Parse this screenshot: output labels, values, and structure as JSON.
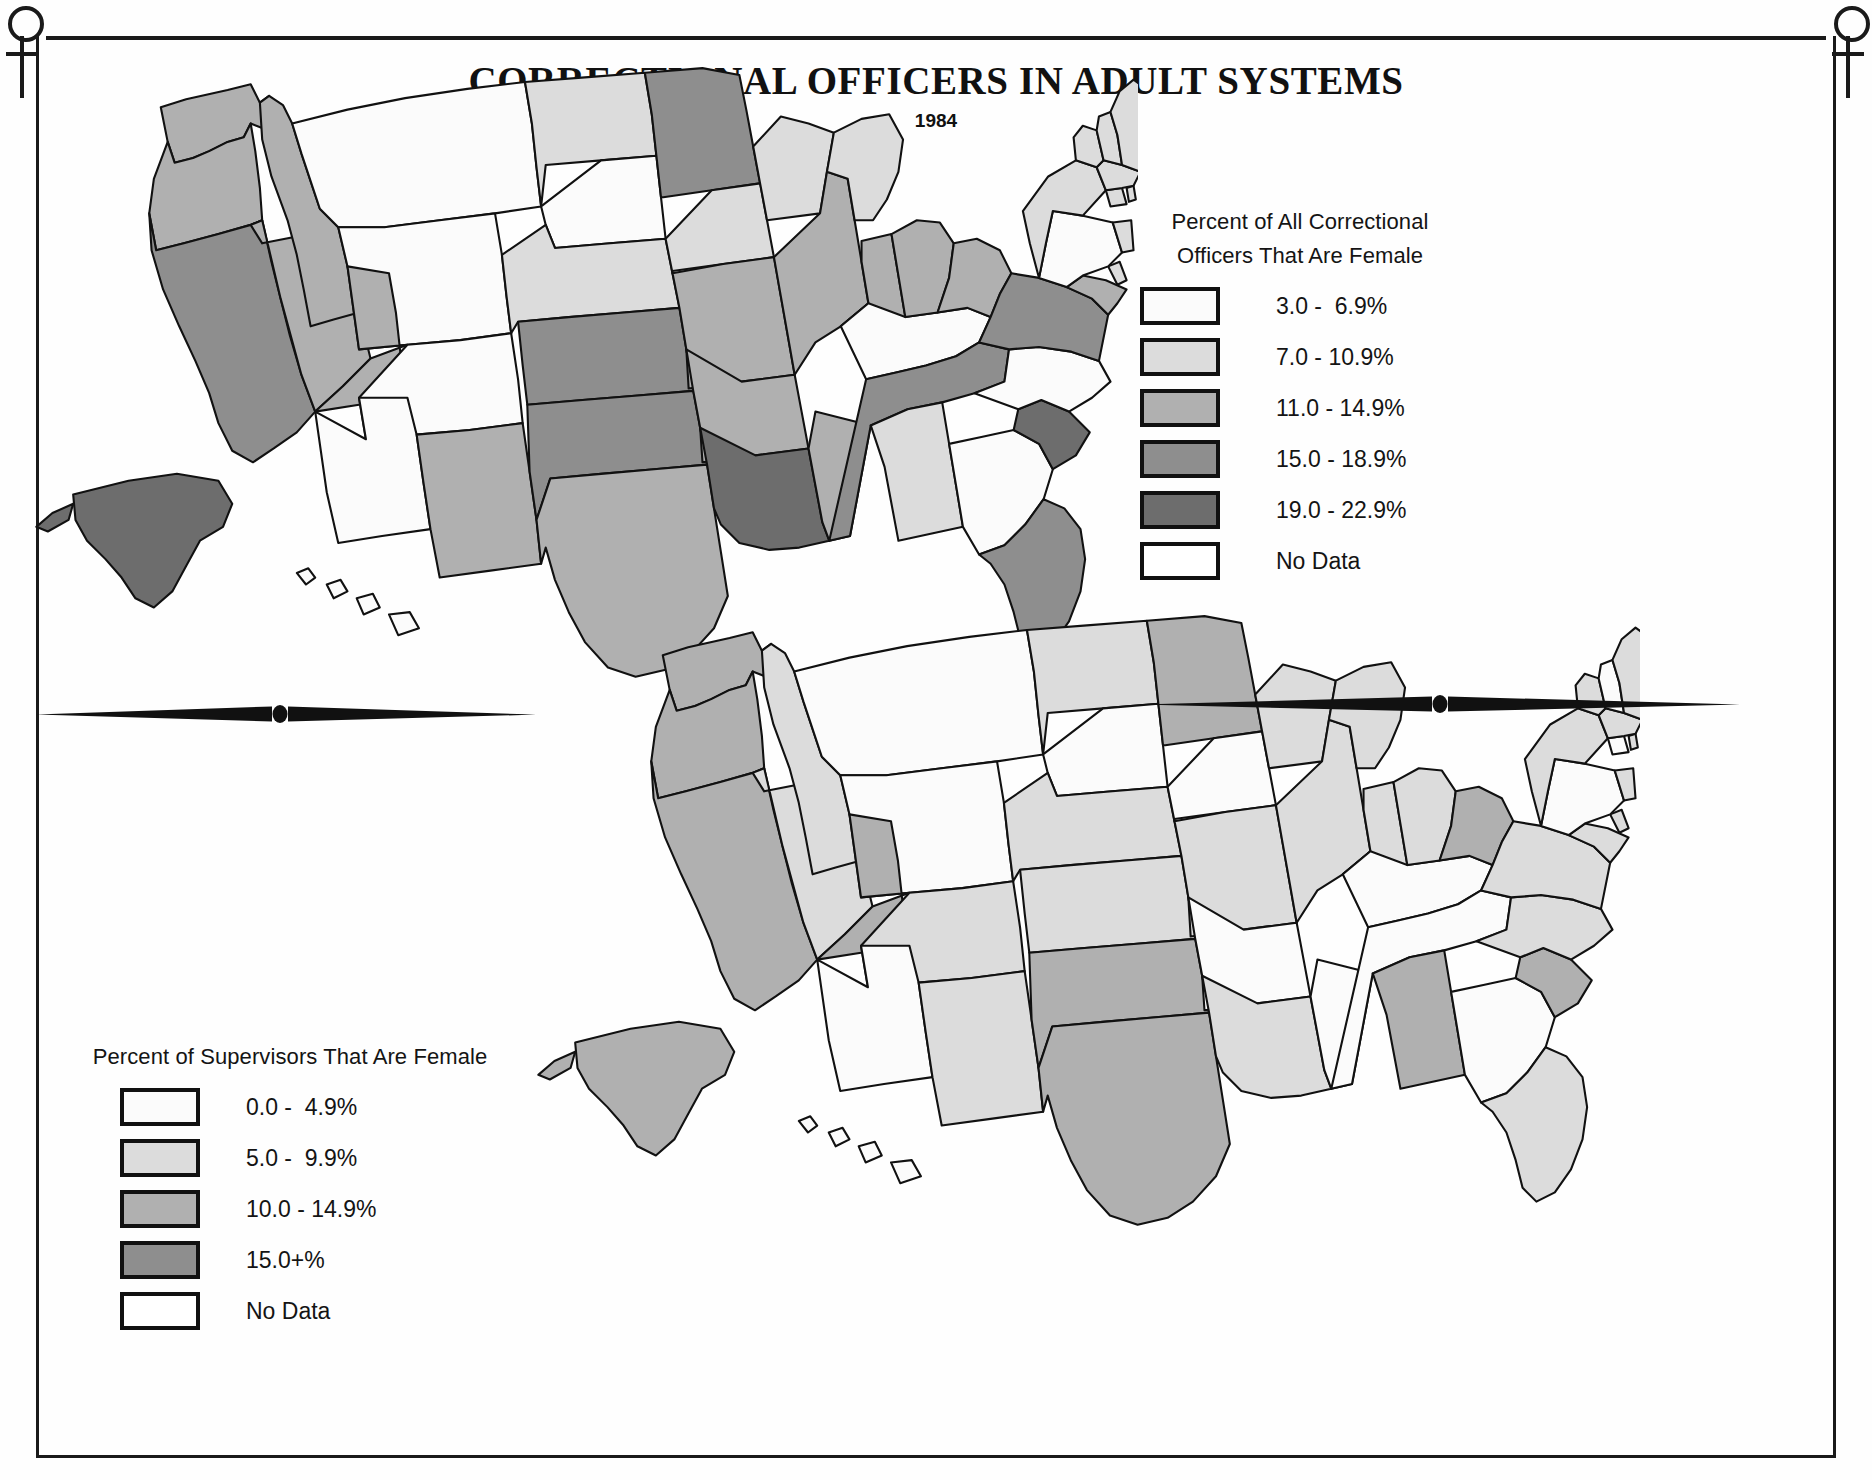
{
  "header": {
    "title": "CORRECTIONAL OFFICERS IN ADULT SYSTEMS",
    "subtitle": "1984"
  },
  "ornaments": {
    "venus_left": "venus-symbol",
    "venus_right": "venus-symbol",
    "divider_top": "tapered-rule-with-dot",
    "divider_bottom": "tapered-rule-with-dot"
  },
  "legend_top": {
    "title_line1": "Percent of All Correctional",
    "title_line2": "Officers That Are Female",
    "items": [
      {
        "label": "3.0 -  6.9%",
        "color": "#fbfbfb"
      },
      {
        "label": "7.0 - 10.9%",
        "color": "#dcdcdc"
      },
      {
        "label": "11.0 - 14.9%",
        "color": "#b0b0b0"
      },
      {
        "label": "15.0 - 18.9%",
        "color": "#8e8e8e"
      },
      {
        "label": "19.0 - 22.9%",
        "color": "#6d6d6d"
      },
      {
        "label": "No Data",
        "color": "#ffffff"
      }
    ]
  },
  "legend_bottom": {
    "title_line1": "Percent of Supervisors That Are Female",
    "items": [
      {
        "label": "0.0 -  4.9%",
        "color": "#fbfbfb"
      },
      {
        "label": "5.0 -  9.9%",
        "color": "#dcdcdc"
      },
      {
        "label": "10.0 - 14.9%",
        "color": "#b0b0b0"
      },
      {
        "label": "15.0+%",
        "color": "#8e8e8e"
      },
      {
        "label": "No Data",
        "color": "#ffffff"
      }
    ]
  },
  "chart_data": {
    "type": "choropleth-map-pair",
    "title": "CORRECTIONAL OFFICERS IN ADULT SYSTEMS",
    "subtitle": "1984",
    "palette": {
      "class1": "#fbfbfb",
      "class2": "#dcdcdc",
      "class3": "#b0b0b0",
      "class4": "#8e8e8e",
      "class5": "#6d6d6d",
      "nodata": "#ffffff"
    },
    "maps": [
      {
        "name": "Percent of All Correctional Officers That Are Female",
        "bins": [
          "3.0 -  6.9%",
          "7.0 - 10.9%",
          "11.0 - 14.9%",
          "15.0 - 18.9%",
          "19.0 - 22.9%",
          "No Data"
        ],
        "states": {
          "WA": 3,
          "OR": 3,
          "CA": 4,
          "NV": 3,
          "ID": 3,
          "MT": 1,
          "WY": 1,
          "UT": 3,
          "AZ": 1,
          "CO": 1,
          "NM": 3,
          "ND": 2,
          "SD": 1,
          "NE": 2,
          "KS": 4,
          "OK": 4,
          "TX": 3,
          "MN": 4,
          "IA": 2,
          "MO": 3,
          "AR": 3,
          "LA": 5,
          "WI": 2,
          "IL": 3,
          "MS": 3,
          "MI": 2,
          "IN": 3,
          "KY": 1,
          "TN": 4,
          "AL": 2,
          "OH": 3,
          "WV": 3,
          "GA": 1,
          "FL": 4,
          "SC": 5,
          "NC": 1,
          "VA": 4,
          "MD": 3,
          "DE": 2,
          "PA": 1,
          "NJ": 2,
          "NY": 2,
          "CT": 2,
          "RI": 2,
          "MA": 2,
          "VT": 2,
          "NH": 2,
          "ME": 2,
          "AK": 5,
          "HI": 1
        }
      },
      {
        "name": "Percent of Supervisors That Are Female",
        "bins": [
          "0.0 -  4.9%",
          "5.0 -  9.9%",
          "10.0 - 14.9%",
          "15.0+%",
          "No Data"
        ],
        "states": {
          "WA": 3,
          "OR": 3,
          "CA": 3,
          "NV": 2,
          "ID": 2,
          "MT": 1,
          "WY": 1,
          "UT": 3,
          "AZ": 1,
          "CO": 2,
          "NM": 2,
          "ND": 2,
          "SD": 1,
          "NE": 2,
          "KS": 2,
          "OK": 3,
          "TX": 3,
          "MN": 3,
          "IA": 1,
          "MO": 2,
          "AR": 1,
          "LA": 2,
          "WI": 2,
          "IL": 2,
          "MS": 1,
          "MI": 2,
          "IN": 2,
          "KY": 1,
          "TN": 1,
          "AL": 3,
          "OH": 2,
          "WV": 3,
          "GA": 1,
          "FL": 2,
          "SC": 3,
          "NC": 2,
          "VA": 2,
          "MD": 2,
          "DE": 2,
          "PA": 1,
          "NJ": 2,
          "NY": 2,
          "CT": 1,
          "RI": 2,
          "MA": 2,
          "VT": 2,
          "NH": 1,
          "ME": 2,
          "AK": 3,
          "HI": 1
        }
      }
    ]
  }
}
